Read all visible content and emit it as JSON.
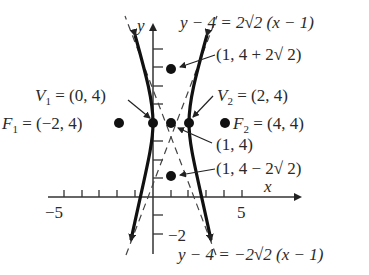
{
  "diagram": {
    "type": "hyperbola",
    "axes": {
      "x_label": "x",
      "y_label": "y",
      "x_tick_label_neg": "−5",
      "x_tick_label_pos": "5",
      "y_tick_label_neg": "−2"
    },
    "labels": {
      "asymptote_top": "y − 4 = 2√2 (x − 1)",
      "asymptote_bottom": "y − 4 = −2√2 (x − 1)",
      "point_top": "(1, 4 + 2√ 2)",
      "point_bottom": "(1, 4 − 2√ 2)",
      "center": "(1, 4)",
      "v1_name": "V",
      "v1_sub": "1",
      "v1_value": " = (0, 4)",
      "v2_name": "V",
      "v2_sub": "2",
      "v2_value": " = (2, 4)",
      "f1_name": "F",
      "f1_sub": "1",
      "f1_value": " = (−2, 4)",
      "f2_name": "F",
      "f2_sub": "2",
      "f2_value": " = (4, 4)"
    },
    "points": [
      {
        "name": "V1",
        "x": 0,
        "y": 4
      },
      {
        "name": "V2",
        "x": 2,
        "y": 4
      },
      {
        "name": "F1",
        "x": -2,
        "y": 4
      },
      {
        "name": "F2",
        "x": 4,
        "y": 4
      },
      {
        "name": "center",
        "x": 1,
        "y": 4
      },
      {
        "name": "top",
        "x": 1,
        "y": 6.83
      },
      {
        "name": "bottom",
        "x": 1,
        "y": 1.17
      }
    ]
  }
}
